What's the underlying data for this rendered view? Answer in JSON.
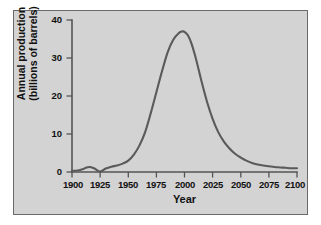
{
  "chart_data": {
    "type": "line",
    "title": "",
    "xlabel": "Year",
    "ylabel_line1": "Annual production",
    "ylabel_line2": "(billions of barrels)",
    "xlim": [
      1900,
      2100
    ],
    "ylim": [
      0,
      40
    ],
    "grid": false,
    "legend": false,
    "xticks": [
      1900,
      1925,
      1950,
      1975,
      2000,
      2025,
      2050,
      2075,
      2100
    ],
    "xtick_labels": [
      "1900",
      "1925",
      "1950",
      "1975",
      "2000",
      "2025",
      "2050",
      "2075",
      "2100"
    ],
    "yticks": [
      0,
      10,
      20,
      30,
      40
    ],
    "ytick_labels": [
      "0",
      "10",
      "20",
      "30",
      "40"
    ],
    "series": [
      {
        "name": "Annual oil production",
        "x": [
          1900,
          1905,
          1910,
          1913,
          1916,
          1920,
          1925,
          1930,
          1935,
          1940,
          1945,
          1950,
          1955,
          1960,
          1965,
          1970,
          1975,
          1980,
          1985,
          1990,
          1995,
          1998,
          2000,
          2003,
          2006,
          2010,
          2015,
          2020,
          2025,
          2030,
          2035,
          2040,
          2045,
          2050,
          2055,
          2060,
          2065,
          2070,
          2075,
          2080,
          2085,
          2090,
          2095,
          2100
        ],
        "y": [
          0.3,
          0.4,
          0.8,
          1.2,
          1.3,
          0.9,
          0.1,
          0.9,
          1.4,
          1.7,
          2.2,
          3.0,
          4.6,
          7.0,
          10.5,
          15.5,
          21.0,
          26.5,
          31.5,
          34.8,
          36.6,
          37.0,
          36.9,
          36.0,
          34.0,
          30.0,
          24.0,
          18.5,
          14.0,
          10.5,
          8.0,
          6.2,
          4.8,
          3.8,
          3.0,
          2.4,
          2.0,
          1.7,
          1.5,
          1.3,
          1.2,
          1.1,
          1.0,
          1.0
        ]
      }
    ],
    "annotations": {
      "peak_value": 37,
      "peak_year": 1999
    }
  },
  "colors": {
    "plot_background": "#d3d3d3",
    "frame_border": "#6a6a6a",
    "curve": "#5a5a5a",
    "axis": "#545454",
    "text": "#111111",
    "page_background": "#ffffff"
  }
}
